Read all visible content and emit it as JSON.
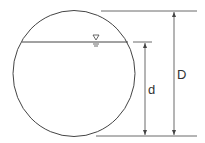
{
  "diagram": {
    "labels": {
      "depth": "d",
      "diameter": "D"
    },
    "symbols": {
      "water_surface": "water-surface-triangle"
    },
    "colors": {
      "line": "#444444",
      "background": "#ffffff"
    }
  }
}
